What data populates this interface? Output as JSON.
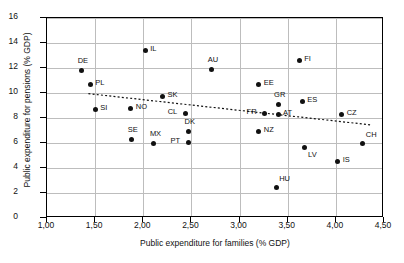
{
  "chart_data": {
    "type": "scatter",
    "title": "",
    "xlabel": "Public expenditure for families (% GDP)",
    "ylabel": "Public expenditure for pensions (% GDP)",
    "xlim": [
      1.0,
      4.5
    ],
    "ylim": [
      0,
      16
    ],
    "xticks": [
      "1,00",
      "1,50",
      "2,00",
      "2,50",
      "3,00",
      "3,50",
      "4,00",
      "4,50"
    ],
    "xtick_values": [
      1.0,
      1.5,
      2.0,
      2.5,
      3.0,
      3.5,
      4.0,
      4.5
    ],
    "yticks": [
      "0",
      "2",
      "4",
      "6",
      "8",
      "10",
      "12",
      "14",
      "16"
    ],
    "ytick_values": [
      0,
      2,
      4,
      6,
      8,
      10,
      12,
      14,
      16
    ],
    "grid": true,
    "legend": "none",
    "decimal_separator": "comma",
    "points": [
      {
        "label": "DE",
        "x": 1.36,
        "y": 11.84,
        "label_pos": "top-left"
      },
      {
        "label": "PL",
        "x": 1.45,
        "y": 10.72,
        "label_pos": "right"
      },
      {
        "label": "IL",
        "x": 2.02,
        "y": 13.44,
        "label_pos": "right"
      },
      {
        "label": "AU",
        "x": 2.71,
        "y": 11.92,
        "label_pos": "top-left"
      },
      {
        "label": "FI",
        "x": 3.62,
        "y": 12.64,
        "label_pos": "right"
      },
      {
        "label": "SI",
        "x": 1.5,
        "y": 8.72,
        "label_pos": "right"
      },
      {
        "label": "NO",
        "x": 1.87,
        "y": 8.8,
        "label_pos": "right"
      },
      {
        "label": "SK",
        "x": 2.2,
        "y": 9.76,
        "label_pos": "right"
      },
      {
        "label": "EE",
        "x": 3.2,
        "y": 10.72,
        "label_pos": "right"
      },
      {
        "label": "GR",
        "x": 3.4,
        "y": 9.12,
        "label_pos": "top-left"
      },
      {
        "label": "ES",
        "x": 3.65,
        "y": 9.36,
        "label_pos": "right"
      },
      {
        "label": "CL",
        "x": 2.44,
        "y": 8.4,
        "label_pos": "left"
      },
      {
        "label": "FR",
        "x": 3.26,
        "y": 8.4,
        "label_pos": "left"
      },
      {
        "label": "AT",
        "x": 3.4,
        "y": 8.32,
        "label_pos": "right"
      },
      {
        "label": "CZ",
        "x": 4.06,
        "y": 8.32,
        "label_pos": "right"
      },
      {
        "label": "SE",
        "x": 1.88,
        "y": 6.32,
        "label_pos": "top-left"
      },
      {
        "label": "MX",
        "x": 2.11,
        "y": 6.0,
        "label_pos": "top-left"
      },
      {
        "label": "DK",
        "x": 2.47,
        "y": 6.96,
        "label_pos": "top-left"
      },
      {
        "label": "PT",
        "x": 2.47,
        "y": 6.08,
        "label_pos": "left"
      },
      {
        "label": "NZ",
        "x": 3.2,
        "y": 6.96,
        "label_pos": "right"
      },
      {
        "label": "LV",
        "x": 3.67,
        "y": 5.68,
        "label_pos": "bottom-right"
      },
      {
        "label": "CH",
        "x": 4.28,
        "y": 6.0,
        "label_pos": "top-right"
      },
      {
        "label": "IS",
        "x": 4.02,
        "y": 4.56,
        "label_pos": "right"
      },
      {
        "label": "HU",
        "x": 3.38,
        "y": 2.48,
        "label_pos": "top-right"
      }
    ],
    "trendline": {
      "style": "dotted",
      "x_start": 1.43,
      "y_start": 9.95,
      "x_end": 4.36,
      "y_end": 7.45
    }
  }
}
